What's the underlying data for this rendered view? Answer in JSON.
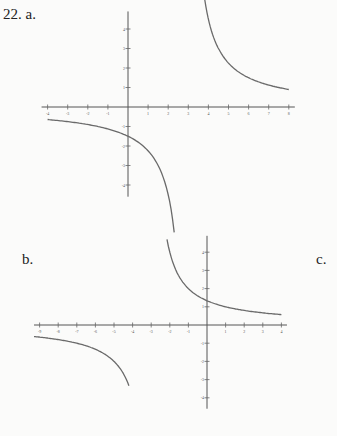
{
  "labels": {
    "problem": "22. a.",
    "b": "b.",
    "c": "c."
  },
  "chart_data": [
    {
      "type": "line",
      "title": "22. a.",
      "xlim": [
        -4,
        8
      ],
      "ylim": [
        -4,
        4
      ],
      "x_ticks": [
        -4,
        -3,
        -2,
        -1,
        1,
        2,
        3,
        4,
        5,
        6,
        7,
        8
      ],
      "y_ticks": [
        -4,
        -3,
        -2,
        -1,
        1,
        2,
        3,
        4
      ],
      "vertical_asymptote": 3,
      "horizontal_asymptote": 0,
      "function": "y = 4.5/(x-3)",
      "origin_px": [
        128,
        107
      ],
      "unit_px": [
        20.1,
        19.5
      ],
      "branches": [
        [
          -4,
          2.3
        ],
        [
          3.6,
          8
        ]
      ]
    },
    {
      "type": "line",
      "title": "b.",
      "xlim": [
        -9,
        4
      ],
      "ylim": [
        -4,
        4
      ],
      "x_ticks": [
        -9,
        -8,
        -7,
        -6,
        -5,
        -4,
        -3,
        -2,
        -1,
        1,
        2,
        3,
        4
      ],
      "y_ticks": [
        -4,
        -3,
        -2,
        -1,
        1,
        2,
        3,
        4
      ],
      "vertical_asymptote": -3,
      "horizontal_asymptote": 0,
      "function": "y = 4/(x+3)",
      "origin_px": [
        207,
        325
      ],
      "unit_px": [
        18.6,
        18.2
      ],
      "branches": [
        [
          -9.3,
          -4.2
        ],
        [
          -2.15,
          4
        ]
      ]
    }
  ]
}
